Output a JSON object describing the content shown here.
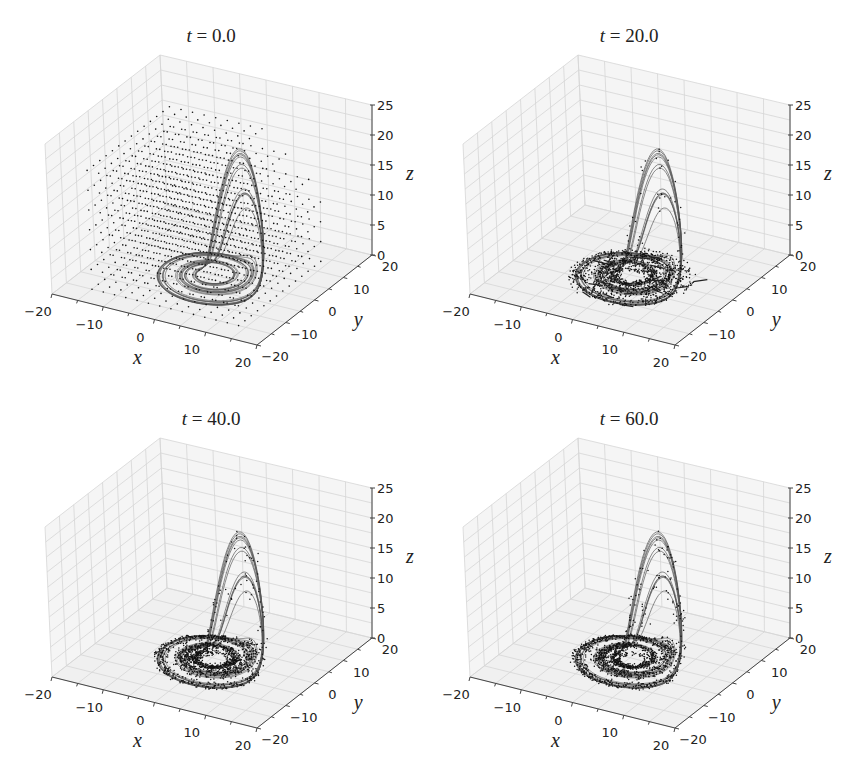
{
  "figure": {
    "caption_partial": ""
  },
  "chart_data": [
    {
      "type": "scatter",
      "projection": "3d",
      "title_var": "t",
      "title_value": "0.0",
      "title": "t = 0.0",
      "xlabel": "x",
      "ylabel": "y",
      "zlabel": "z",
      "xlim": [
        -20,
        20
      ],
      "ylim": [
        -20,
        20
      ],
      "zlim": [
        0,
        25
      ],
      "xticks": [
        "−20",
        "−10",
        "0",
        "10",
        "20"
      ],
      "yticks": [
        "−20",
        "−10",
        "0",
        "10",
        "20"
      ],
      "zticks": [
        "0",
        "5",
        "10",
        "15",
        "20",
        "25"
      ],
      "grid": true,
      "series": [
        {
          "name": "attractor trajectory",
          "kind": "line",
          "description": "Rössler-type attractor: ring in z≈0 plane spanning x≈-10..12, y≈-11..9, with fold rising to z≈17"
        },
        {
          "name": "particles",
          "kind": "points",
          "description": "uniform 3D lattice of initial points filling x,y ∈ [-15,15], z ∈ [0,20]"
        }
      ]
    },
    {
      "type": "scatter",
      "projection": "3d",
      "title_var": "t",
      "title_value": "20.0",
      "title": "t = 20.0",
      "xlabel": "x",
      "ylabel": "y",
      "zlabel": "z",
      "xlim": [
        -20,
        20
      ],
      "ylim": [
        -20,
        20
      ],
      "zlim": [
        0,
        25
      ],
      "xticks": [
        "−20",
        "−10",
        "0",
        "10",
        "20"
      ],
      "yticks": [
        "−20",
        "−10",
        "0",
        "10",
        "20"
      ],
      "zticks": [
        "0",
        "5",
        "10",
        "15",
        "20",
        "25"
      ],
      "grid": true,
      "series": [
        {
          "name": "attractor trajectory",
          "kind": "line"
        },
        {
          "name": "particles",
          "kind": "points",
          "description": "points collapsed onto disk inside and along attractor ring, with streaks"
        }
      ]
    },
    {
      "type": "scatter",
      "projection": "3d",
      "title_var": "t",
      "title_value": "40.0",
      "title": "t = 40.0",
      "xlabel": "x",
      "ylabel": "y",
      "zlabel": "z",
      "xlim": [
        -20,
        20
      ],
      "ylim": [
        -20,
        20
      ],
      "zlim": [
        0,
        25
      ],
      "xticks": [
        "−20",
        "−10",
        "0",
        "10",
        "20"
      ],
      "yticks": [
        "−20",
        "−10",
        "0",
        "10",
        "20"
      ],
      "zticks": [
        "0",
        "5",
        "10",
        "15",
        "20",
        "25"
      ],
      "grid": true,
      "series": [
        {
          "name": "attractor trajectory",
          "kind": "line"
        },
        {
          "name": "particles",
          "kind": "points",
          "description": "points mostly on attractor band, a few stragglers inside ring"
        }
      ]
    },
    {
      "type": "scatter",
      "projection": "3d",
      "title_var": "t",
      "title_value": "60.0",
      "title": "t = 60.0",
      "xlabel": "x",
      "ylabel": "y",
      "zlabel": "z",
      "xlim": [
        -20,
        20
      ],
      "ylim": [
        -20,
        20
      ],
      "zlim": [
        0,
        25
      ],
      "xticks": [
        "−20",
        "−10",
        "0",
        "10",
        "20"
      ],
      "yticks": [
        "−20",
        "−10",
        "0",
        "10",
        "20"
      ],
      "zticks": [
        "0",
        "5",
        "10",
        "15",
        "20",
        "25"
      ],
      "grid": true,
      "series": [
        {
          "name": "attractor trajectory",
          "kind": "line"
        },
        {
          "name": "particles",
          "kind": "points",
          "description": "points fully settled onto attractor band and fold"
        }
      ]
    }
  ]
}
